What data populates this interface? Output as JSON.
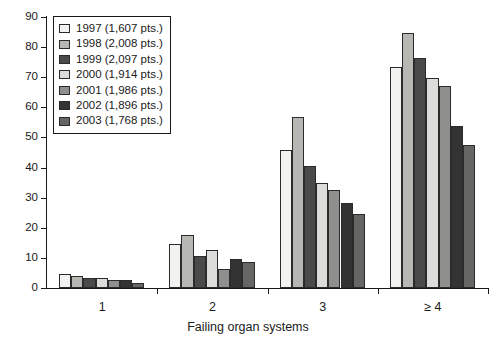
{
  "chart_data": {
    "type": "bar",
    "title": "",
    "subtitle": "",
    "xlabel": "Failing organ systems",
    "ylabel": "",
    "categories": [
      "1",
      "2",
      "3",
      "≥ 4"
    ],
    "ylim": [
      0,
      90
    ],
    "yticks": [
      0,
      10,
      20,
      30,
      40,
      50,
      60,
      70,
      80,
      90
    ],
    "ytick_labels": [
      "0",
      "10",
      "20",
      "30",
      "40",
      "50",
      "60",
      "70",
      "80",
      "90"
    ],
    "grid": false,
    "legend_position": "upper-left",
    "bar_orientation": "vertical",
    "series": [
      {
        "name": "1997 (1,607 pts.)",
        "year": "1997",
        "points": "1,607 pts.",
        "color": "#f2f2f0",
        "values": [
          4.5,
          14.5,
          45.8,
          73.5
        ]
      },
      {
        "name": "1998 (2,008 pts.)",
        "year": "1998",
        "points": "2,008 pts.",
        "color": "#b7b7b4",
        "values": [
          4.0,
          17.7,
          56.7,
          84.8
        ]
      },
      {
        "name": "1999 (2,097 pts.)",
        "year": "1999",
        "points": "2,097 pts.",
        "color": "#4a4a4a",
        "values": [
          3.3,
          10.7,
          40.5,
          76.5
        ]
      },
      {
        "name": "2000 (1,914 pts.)",
        "year": "2000",
        "points": "1,914 pts.",
        "color": "#dcdcda",
        "values": [
          3.2,
          12.6,
          35.0,
          69.7
        ]
      },
      {
        "name": "2001 (1,986 pts.)",
        "year": "2001",
        "points": "1,986 pts.",
        "color": "#8f8f8d",
        "values": [
          2.8,
          6.3,
          32.5,
          67.2
        ]
      },
      {
        "name": "2002 (1,896 pts.)",
        "year": "2002",
        "points": "1,896 pts.",
        "color": "#333333",
        "values": [
          2.8,
          9.8,
          28.1,
          53.8
        ]
      },
      {
        "name": "2003 (1,768 pts.)",
        "year": "2003",
        "points": "1,768 pts.",
        "color": "#666664",
        "values": [
          1.8,
          8.5,
          24.5,
          47.6
        ]
      }
    ]
  },
  "axis": {
    "x_title": "Failing organ systems"
  },
  "colors": {
    "axis": "#1a1a1a",
    "bar_outline": "#2b2b2b",
    "background": "#ffffff",
    "text": "#1a1a1a"
  }
}
